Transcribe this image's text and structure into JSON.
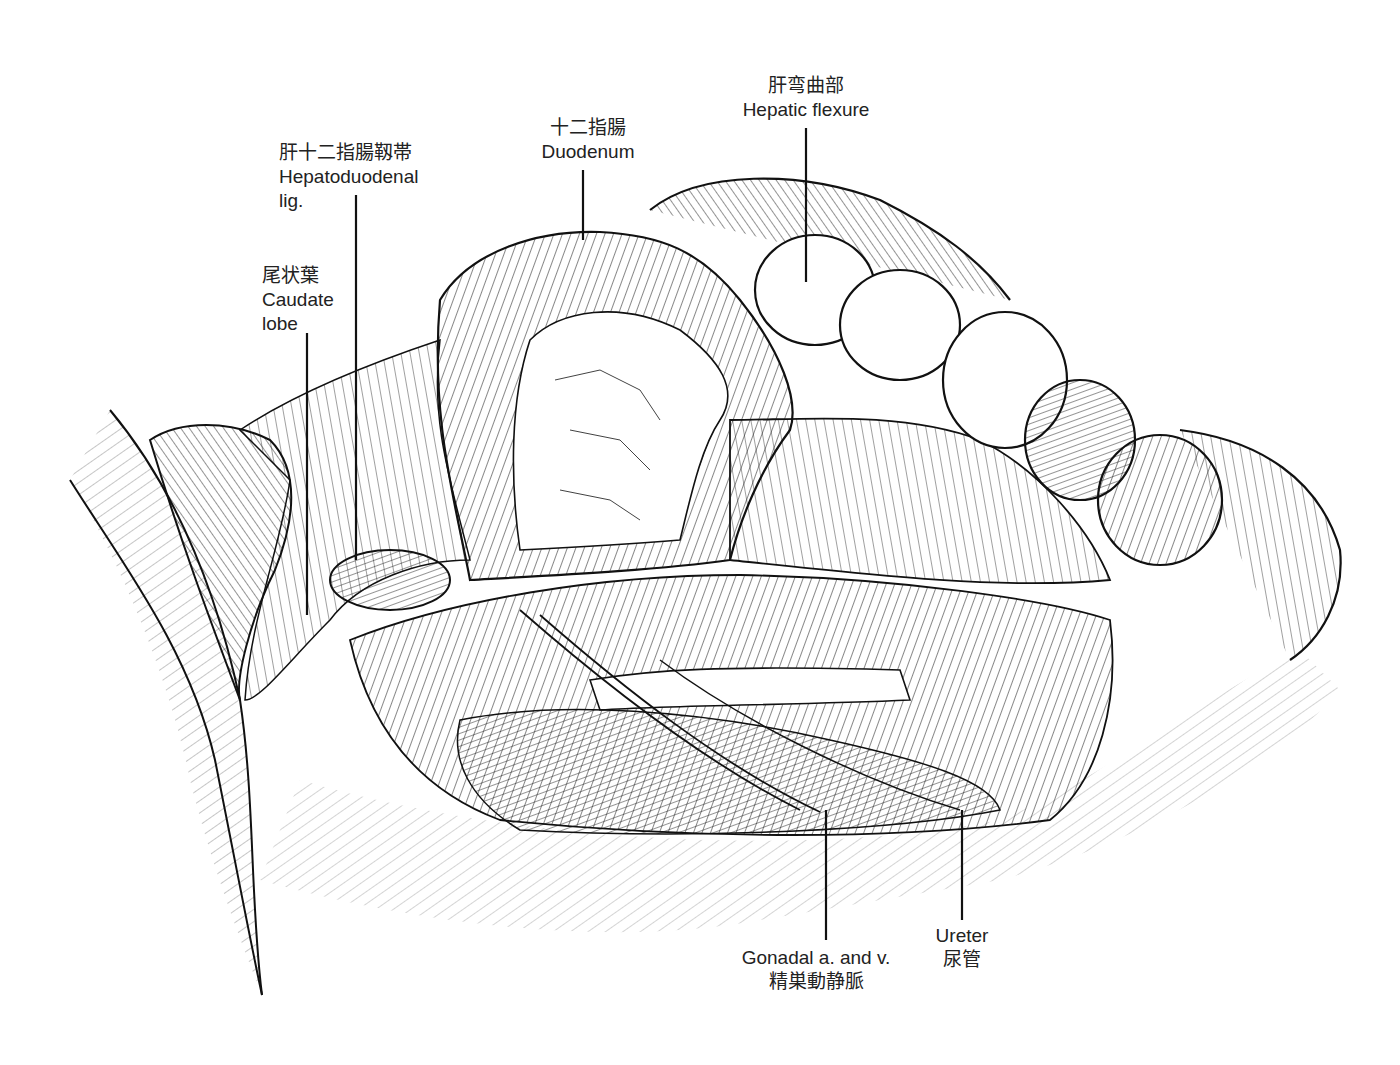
{
  "figure": {
    "type": "anatomical-illustration",
    "style": "black ink line drawing with hatching",
    "background": "#ffffff",
    "ink": "#111111"
  },
  "labels": [
    {
      "id": "hepatic-flexure",
      "jp": "肝弯曲部",
      "en": "Hepatic flexure",
      "x": 806,
      "y": 76,
      "align": "center",
      "leader": {
        "x1": 806,
        "y1": 128,
        "x2": 806,
        "y2": 280
      }
    },
    {
      "id": "duodenum",
      "jp": "十二指腸",
      "en": "Duodenum",
      "x": 588,
      "y": 118,
      "align": "center",
      "leader": {
        "x1": 583,
        "y1": 170,
        "x2": 583,
        "y2": 240
      }
    },
    {
      "id": "hepatoduodenal-lig",
      "jp": "肝十二指腸靱帯",
      "en": "Hepatoduodenal",
      "en2": "lig.",
      "x": 279,
      "y": 143,
      "align": "left",
      "leader": {
        "x1": 356,
        "y1": 195,
        "x2": 356,
        "y2": 560
      }
    },
    {
      "id": "caudate-lobe",
      "jp": "尾状葉",
      "en": "Caudate",
      "en2": "lobe",
      "x": 262,
      "y": 266,
      "align": "left",
      "leader": {
        "x1": 307,
        "y1": 333,
        "x2": 307,
        "y2": 615
      }
    },
    {
      "id": "gonadal-vessels",
      "en": "Gonadal a. and v.",
      "jp": "精巣動静脈",
      "x": 816,
      "y": 948,
      "align": "center",
      "leader": {
        "x1": 826,
        "y1": 810,
        "x2": 826,
        "y2": 940
      }
    },
    {
      "id": "ureter",
      "en": "Ureter",
      "jp": "尿管",
      "x": 962,
      "y": 926,
      "align": "center",
      "leader": {
        "x1": 962,
        "y1": 810,
        "x2": 962,
        "y2": 922
      }
    }
  ]
}
